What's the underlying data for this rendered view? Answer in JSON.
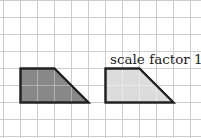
{
  "diagram": {
    "type": "grid-enlargement",
    "grid": {
      "spacing_px": 17,
      "x_offset_px": 3,
      "y_offset_px": 0,
      "line_color": "#cccccc",
      "background": "#ffffff"
    },
    "shapes": [
      {
        "name": "original-trapezoid",
        "fill": "#888888",
        "stroke": "#222222",
        "points_grid": [
          [
            1,
            4
          ],
          [
            3,
            4
          ],
          [
            5,
            6
          ],
          [
            1,
            6
          ]
        ]
      },
      {
        "name": "image-trapezoid",
        "fill": "#dcdcdc",
        "stroke": "#222222",
        "points_grid": [
          [
            6,
            4
          ],
          [
            8,
            4
          ],
          [
            10,
            6
          ],
          [
            6,
            6
          ]
        ]
      }
    ],
    "label": "scale factor 1"
  }
}
